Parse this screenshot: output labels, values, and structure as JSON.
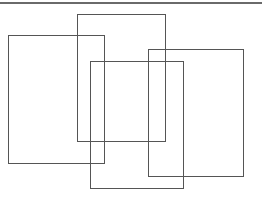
{
  "diagram": {
    "background": "#ffffff",
    "stroke_color": "#555555",
    "rule": {
      "y": 3,
      "color": "#6a6a6a",
      "thickness": 2
    },
    "rectangles": [
      {
        "id": "rect-left",
        "x": 8,
        "y": 35,
        "width": 97,
        "height": 129
      },
      {
        "id": "rect-top-middle",
        "x": 77,
        "y": 14,
        "width": 89,
        "height": 128
      },
      {
        "id": "rect-bottom-middle",
        "x": 90,
        "y": 61,
        "width": 94,
        "height": 128
      },
      {
        "id": "rect-right",
        "x": 148,
        "y": 49,
        "width": 96,
        "height": 128
      }
    ]
  }
}
